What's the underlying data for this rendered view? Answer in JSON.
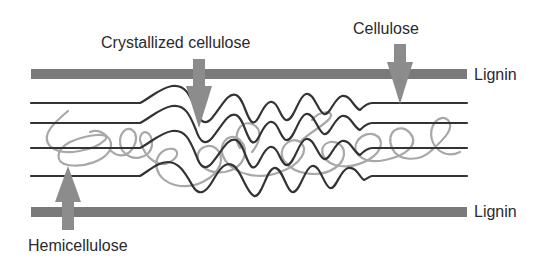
{
  "diagram": {
    "type": "schematic",
    "labels": {
      "crystallized_cellulose": "Crystallized cellulose",
      "cellulose": "Cellulose",
      "lignin_top": "Lignin",
      "lignin_bottom": "Lignin",
      "hemicellulose": "Hemicellulose"
    },
    "colors": {
      "lignin_bar": "#7a7a7a",
      "cellulose_line": "#333333",
      "hemicellulose_line": "#a8a8a8",
      "arrow": "#8c8c8c",
      "text": "#2a2a2a"
    },
    "components": [
      {
        "name": "Lignin",
        "shape": "thick bar",
        "count": 2,
        "position": "top and bottom"
      },
      {
        "name": "Cellulose",
        "shape": "straight parallel lines",
        "count": 4,
        "regions": [
          "left",
          "right"
        ]
      },
      {
        "name": "Crystallized cellulose",
        "shape": "wavy lines",
        "region": "middle"
      },
      {
        "name": "Hemicellulose",
        "shape": "tangled loops",
        "color": "light gray"
      }
    ]
  }
}
